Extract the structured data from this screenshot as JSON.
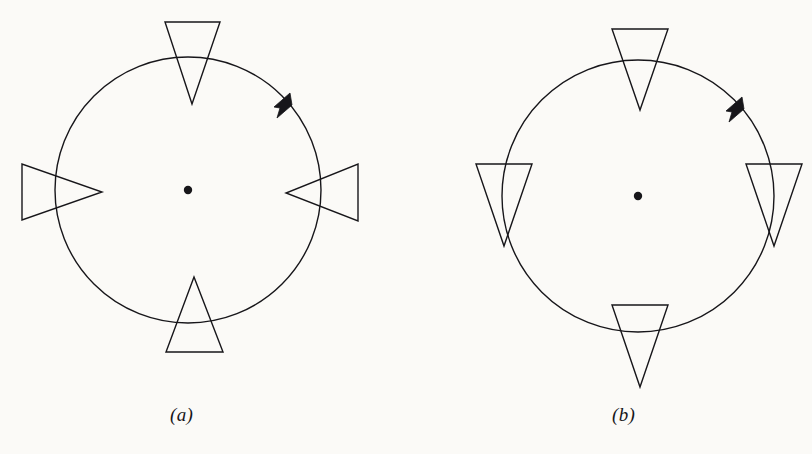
{
  "figure": {
    "background_color": "#fbfaf7",
    "ink_color": "#17161a",
    "caption_a": "(a)",
    "caption_b": "(b)",
    "panels": [
      {
        "id": "a",
        "label": "(a)",
        "description": "circle with four inward-pointing triangles at north, east, south and west, counterclockwise arrow",
        "circle": {
          "cx": 188,
          "cy": 190,
          "r": 133,
          "stroke_width": 1.4
        },
        "center_dot": {
          "cx": 188,
          "cy": 190,
          "r": 4.2
        },
        "arrow": {
          "angle_deg": 48,
          "direction": "counterclockwise"
        },
        "triangle_count": 4,
        "triangle_orientation": "radially inward",
        "triangles": [
          {
            "position": "north",
            "angle_deg": 90,
            "points_toward": "center"
          },
          {
            "position": "west",
            "angle_deg": 180,
            "points_toward": "center"
          },
          {
            "position": "south",
            "angle_deg": 270,
            "points_toward": "center"
          },
          {
            "position": "east",
            "angle_deg": 0,
            "points_toward": "center"
          }
        ]
      },
      {
        "id": "b",
        "label": "(b)",
        "description": "circle with four identically downward-pointing triangles at north, east, south and west, counterclockwise arrow",
        "circle": {
          "cx": 638,
          "cy": 196,
          "r": 136,
          "stroke_width": 1.4
        },
        "center_dot": {
          "cx": 638,
          "cy": 196,
          "r": 4.2
        },
        "arrow": {
          "angle_deg": 48,
          "direction": "counterclockwise"
        },
        "triangle_count": 4,
        "triangle_orientation": "all pointing down",
        "triangles": [
          {
            "position": "north",
            "angle_deg": 90,
            "points_toward": "down"
          },
          {
            "position": "west",
            "angle_deg": 180,
            "points_toward": "down"
          },
          {
            "position": "south",
            "angle_deg": 270,
            "points_toward": "down"
          },
          {
            "position": "east",
            "angle_deg": 0,
            "points_toward": "down"
          }
        ]
      }
    ]
  }
}
